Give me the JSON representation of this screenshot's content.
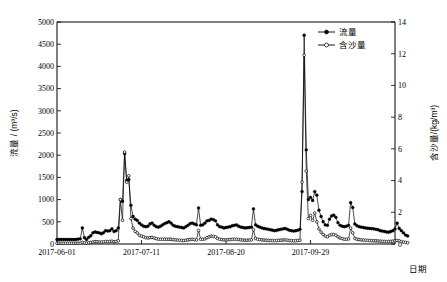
{
  "chart_data": {
    "type": "line",
    "title": "",
    "xlabel": "日期",
    "ylabel": "流量 / (m³/s)",
    "y2label": "含沙量/(kg/m³)",
    "ylim": [
      0,
      5000
    ],
    "y2lim": [
      0,
      14
    ],
    "yticks": [
      0,
      500,
      1000,
      1500,
      2000,
      2500,
      3000,
      3500,
      4000,
      4500,
      5000
    ],
    "y2ticks": [
      0,
      2,
      4,
      6,
      8,
      10,
      12,
      14
    ],
    "xticklabels": [
      "2017-06-01",
      "2017-07-11",
      "2017-08-20",
      "2017-09-29"
    ],
    "xtickindices": [
      0,
      40,
      80,
      120
    ],
    "grid": false,
    "legend_position": "top-right",
    "legend": [
      "流量",
      "含沙量"
    ],
    "start_date": "2017-06-01",
    "n_points": 161,
    "series": [
      {
        "name": "流量",
        "axis": "left",
        "marker": "filled-circle",
        "values": [
          100,
          100,
          100,
          100,
          100,
          100,
          100,
          100,
          100,
          100,
          110,
          115,
          360,
          140,
          100,
          150,
          185,
          250,
          270,
          260,
          250,
          230,
          255,
          300,
          290,
          300,
          340,
          280,
          300,
          360,
          1000,
          960,
          2030,
          1430,
          1450,
          870,
          620,
          560,
          530,
          470,
          430,
          400,
          390,
          400,
          450,
          470,
          420,
          390,
          380,
          400,
          430,
          460,
          480,
          500,
          470,
          420,
          400,
          390,
          380,
          370,
          360,
          390,
          420,
          460,
          470,
          450,
          430,
          810,
          420,
          430,
          470,
          520,
          530,
          560,
          550,
          520,
          430,
          390,
          380,
          360,
          370,
          380,
          390,
          410,
          420,
          430,
          400,
          380,
          370,
          360,
          365,
          370,
          380,
          790,
          430,
          400,
          380,
          360,
          350,
          340,
          330,
          320,
          310,
          300,
          310,
          320,
          330,
          340,
          350,
          330,
          310,
          300,
          290,
          300,
          310,
          330,
          1180,
          4700,
          2120,
          1000,
          1050,
          980,
          1180,
          1100,
          760,
          620,
          500,
          430,
          420,
          560,
          630,
          650,
          600,
          480,
          420,
          400,
          390,
          400,
          420,
          930,
          820,
          450,
          410,
          390,
          380,
          370,
          360,
          355,
          350,
          345,
          340,
          330,
          320,
          300,
          290,
          280,
          270,
          265,
          280,
          300,
          340,
          470,
          350,
          300,
          250,
          200,
          180
        ]
      },
      {
        "name": "含沙量",
        "axis": "right",
        "marker": "open-circle",
        "values": [
          0.05,
          0.05,
          0.05,
          0.05,
          0.05,
          0.05,
          0.05,
          0.05,
          0.05,
          0.05,
          0.05,
          0.05,
          0.1,
          0.08,
          0.05,
          0.08,
          0.1,
          0.12,
          0.15,
          0.14,
          0.13,
          0.12,
          0.14,
          0.16,
          0.15,
          0.16,
          0.18,
          0.14,
          0.16,
          0.2,
          2.8,
          1.5,
          5.8,
          3.9,
          4.3,
          1.6,
          1.0,
          0.8,
          0.7,
          0.55,
          0.5,
          0.45,
          0.4,
          0.38,
          0.4,
          0.42,
          0.38,
          0.34,
          0.3,
          0.3,
          0.3,
          0.3,
          0.3,
          0.3,
          0.3,
          0.28,
          0.26,
          0.25,
          0.24,
          0.23,
          0.22,
          0.24,
          0.26,
          0.28,
          0.3,
          0.28,
          0.26,
          0.85,
          0.3,
          0.3,
          0.32,
          0.4,
          0.45,
          0.5,
          0.48,
          0.45,
          0.35,
          0.3,
          0.28,
          0.26,
          0.26,
          0.27,
          0.28,
          0.3,
          0.3,
          0.3,
          0.28,
          0.26,
          0.25,
          0.24,
          0.24,
          0.25,
          0.26,
          0.9,
          0.35,
          0.3,
          0.28,
          0.26,
          0.25,
          0.24,
          0.23,
          0.22,
          0.22,
          0.21,
          0.22,
          0.23,
          0.24,
          0.25,
          0.26,
          0.24,
          0.22,
          0.21,
          0.2,
          0.21,
          0.22,
          0.24,
          3.9,
          11.9,
          4.6,
          1.6,
          1.8,
          1.5,
          1.95,
          1.4,
          0.95,
          0.75,
          0.6,
          0.5,
          0.45,
          0.55,
          0.6,
          0.6,
          0.55,
          0.45,
          0.38,
          0.34,
          0.3,
          0.3,
          0.32,
          1.0,
          0.7,
          0.35,
          0.3,
          0.28,
          0.26,
          0.25,
          0.24,
          0.23,
          0.22,
          0.21,
          0.2,
          0.2,
          0.19,
          0.18,
          0.17,
          0.16,
          0.15,
          0.16,
          0.17,
          0.18,
          0.2,
          0.22,
          0.2,
          0.15,
          0.12,
          0.1,
          0.08
        ]
      }
    ]
  },
  "axes": {
    "left_title": "流量 / (m³/s)",
    "right_title": "含沙量/(kg/m³)",
    "x_title": "日期"
  },
  "legend": {
    "items": [
      {
        "label": "流量",
        "marker": "filled-circle"
      },
      {
        "label": "含沙量",
        "marker": "open-circle"
      }
    ]
  }
}
